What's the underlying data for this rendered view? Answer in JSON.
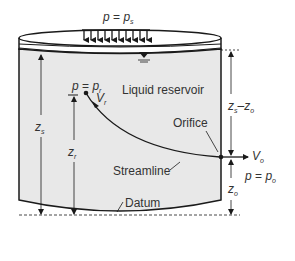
{
  "diagram": {
    "title_pressure": {
      "p": "p",
      "eq": " = ",
      "sub_p": "p",
      "sub": "s"
    },
    "reservoir_label": "Liquid reservoir",
    "point_r": {
      "p": "p",
      "eq": " = ",
      "sub_p": "p",
      "sub": "r",
      "V": "V",
      "V_sub": "r"
    },
    "orifice_label": "Orifice",
    "streamline_label": "Streamline",
    "datum_label": "Datum",
    "outlet": {
      "V": "V",
      "V_sub": "o",
      "p": "p",
      "eq": " = ",
      "sub_p": "p",
      "sub": "o"
    },
    "dims": {
      "zs": {
        "z": "z",
        "sub": "s"
      },
      "zr": {
        "z": "z",
        "sub": "r"
      },
      "zs_minus_zo": {
        "z1": "z",
        "sub1": "s",
        "minus": "–",
        "z2": "z",
        "sub2": "o"
      },
      "zo": {
        "z": "z",
        "sub": "o"
      }
    },
    "colors": {
      "liquid": "#e8e8e8",
      "stroke": "#1a1a1a",
      "text": "#333333"
    }
  }
}
